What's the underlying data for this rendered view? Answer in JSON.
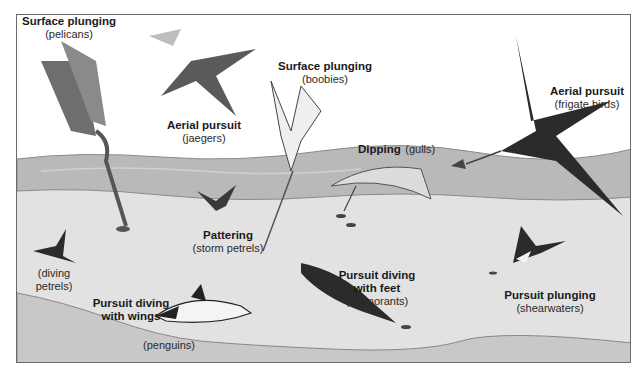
{
  "diagram": {
    "colors": {
      "background": "#ffffff",
      "frame": "#6a6a6a",
      "surface_water": "#b9b9b9",
      "water_column": "#e2e2e2",
      "sea_floor": "#c8c8c8",
      "bird_dark": "#2b2b2b",
      "bird_mid": "#6e6e6e",
      "bird_light": "#f2f2f2"
    },
    "labels": [
      {
        "id": "pelicans",
        "method": "Surface plunging",
        "birds": "(pelicans)"
      },
      {
        "id": "jaegers",
        "method": "Aerial pursuit",
        "birds": "(jaegers)"
      },
      {
        "id": "boobies",
        "method": "Surface plunging",
        "birds": "(boobies)"
      },
      {
        "id": "frigate",
        "method": "Aerial pursuit",
        "birds": "(frigate birds)"
      },
      {
        "id": "gulls",
        "method": "Dipping",
        "birds": "(gulls)"
      },
      {
        "id": "storm-petrels",
        "method": "Pattering",
        "birds": "(storm petrels)"
      },
      {
        "id": "diving-petrels",
        "method": "",
        "birds": "(diving petrels)",
        "birds_line1": "(diving",
        "birds_line2": "petrels)"
      },
      {
        "id": "penguins-method",
        "method": "Pursuit diving with wings",
        "method_line1": "Pursuit diving",
        "method_line2": "with wings"
      },
      {
        "id": "penguins",
        "birds": "(penguins)"
      },
      {
        "id": "cormorants",
        "method": "Pursuit diving with feet",
        "method_line1": "Pursuit diving",
        "method_line2": "with feet",
        "birds": "(cormorants)"
      },
      {
        "id": "shearwaters",
        "method": "Pursuit plunging",
        "birds": "(shearwaters)"
      }
    ]
  }
}
